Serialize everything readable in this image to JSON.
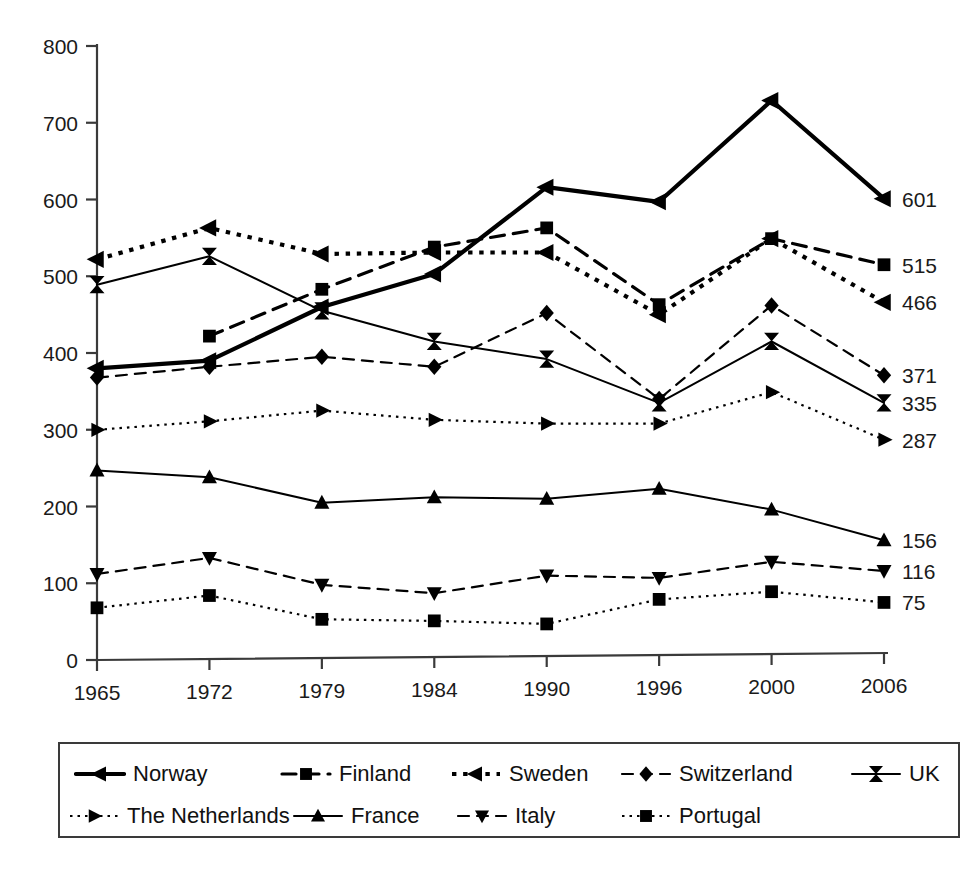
{
  "chart_data": {
    "type": "line",
    "title": "",
    "subtitle": "",
    "xlabel": "",
    "ylabel": "",
    "categories": [
      "1965",
      "1972",
      "1979",
      "1984",
      "1990",
      "1996",
      "2000",
      "2006"
    ],
    "x_tick_labels": [
      "1965",
      "1972",
      "1979",
      "1984",
      "1990",
      "1996",
      "2000",
      "2006"
    ],
    "y_tick_labels": [
      "0",
      "100",
      "200",
      "300",
      "400",
      "500",
      "600",
      "700",
      "800"
    ],
    "y_ticks": [
      0,
      100,
      200,
      300,
      400,
      500,
      600,
      700,
      800
    ],
    "ylim": [
      0,
      800
    ],
    "grid": false,
    "legend_position": "bottom",
    "legend_columns": 5,
    "series": [
      {
        "name": "Norway",
        "marker": "left-triangle",
        "linestyle": "solid",
        "linewidth": 4.2,
        "color": "#000000",
        "values": [
          380,
          390,
          460,
          503,
          616,
          597,
          729,
          601
        ],
        "end_label": "601"
      },
      {
        "name": "Finland",
        "marker": "square",
        "linestyle": "dashed",
        "linewidth": 3.2,
        "color": "#000000",
        "values": [
          null,
          422,
          483,
          538,
          563,
          463,
          549,
          515
        ],
        "end_label": "515"
      },
      {
        "name": "Sweden",
        "marker": "left-triangle",
        "linestyle": "dotted",
        "linewidth": 4.2,
        "color": "#000000",
        "values": [
          522,
          563,
          529,
          531,
          531,
          450,
          549,
          466
        ],
        "end_label": "466"
      },
      {
        "name": "Switzerland",
        "marker": "diamond",
        "linestyle": "dashed",
        "linewidth": 2.2,
        "color": "#000000",
        "values": [
          368,
          382,
          395,
          382,
          452,
          340,
          462,
          371
        ],
        "end_label": "371"
      },
      {
        "name": "UK",
        "marker": "bowtie",
        "linestyle": "solid",
        "linewidth": 2.0,
        "color": "#000000",
        "values": [
          489,
          526,
          455,
          415,
          392,
          335,
          415,
          335
        ],
        "end_label": "335"
      },
      {
        "name": "The Netherlands",
        "marker": "right-triangle",
        "linestyle": "dotted",
        "linewidth": 2.2,
        "color": "#000000",
        "values": [
          300,
          311,
          325,
          313,
          308,
          308,
          349,
          287
        ],
        "end_label": "287"
      },
      {
        "name": "France",
        "marker": "up-triangle",
        "linestyle": "solid",
        "linewidth": 2.0,
        "color": "#000000",
        "values": [
          247,
          238,
          205,
          212,
          210,
          223,
          196,
          156
        ],
        "end_label": "156"
      },
      {
        "name": "Italy",
        "marker": "down-triangle",
        "linestyle": "dashed",
        "linewidth": 2.2,
        "color": "#000000",
        "values": [
          112,
          133,
          98,
          87,
          110,
          107,
          128,
          116
        ],
        "end_label": "116"
      },
      {
        "name": "Portugal",
        "marker": "square",
        "linestyle": "dotted",
        "linewidth": 2.2,
        "color": "#000000",
        "values": [
          68,
          84,
          53,
          51,
          47,
          79,
          89,
          75
        ],
        "end_label": "75"
      }
    ],
    "end_labels": [
      "601",
      "515",
      "466",
      "371",
      "335",
      "287",
      "156",
      "116",
      "75"
    ]
  },
  "legend": {
    "rows": [
      [
        {
          "label": "Norway"
        },
        {
          "label": "Finland"
        },
        {
          "label": "Sweden"
        },
        {
          "label": "Switzerland"
        },
        {
          "label": "UK"
        }
      ],
      [
        {
          "label": "The Netherlands"
        },
        {
          "label": "France"
        },
        {
          "label": "Italy"
        },
        {
          "label": "Portugal"
        }
      ]
    ]
  }
}
